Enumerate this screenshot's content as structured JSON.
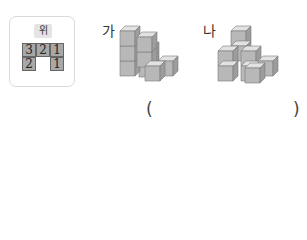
{
  "top_view": {
    "label": "위",
    "cells": [
      {
        "row": 0,
        "col": 0,
        "value": "3"
      },
      {
        "row": 0,
        "col": 1,
        "value": "2"
      },
      {
        "row": 0,
        "col": 2,
        "value": "1"
      },
      {
        "row": 1,
        "col": 0,
        "value": "2"
      },
      {
        "row": 1,
        "col": 2,
        "value": "1"
      }
    ]
  },
  "figures": [
    {
      "label": "가"
    },
    {
      "label": "나"
    }
  ],
  "answer": {
    "open": "(",
    "close": ")",
    "value": ""
  },
  "colors": {
    "cube_top": "#e0e0e0",
    "cube_front": "#b5b5b5",
    "cube_side": "#9a9a9a",
    "cell_fill": "#a8a8a8"
  }
}
